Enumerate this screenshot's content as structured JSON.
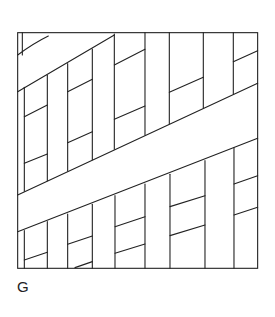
{
  "figure": {
    "label": "G",
    "stroke_color": "#222222",
    "background": "#ffffff"
  }
}
